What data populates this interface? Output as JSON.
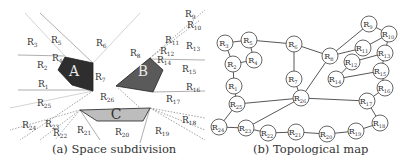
{
  "figure": {
    "left_panel": {
      "caption": "(a) Space subdivision",
      "obstacles": [
        {
          "label": "A",
          "fill": "#2e2e2e",
          "points": [
            [
              65,
              57
            ],
            [
              58,
              70
            ],
            [
              72,
              85
            ],
            [
              93,
              91
            ],
            [
              93,
              63
            ]
          ],
          "label_pos": [
            74,
            76
          ]
        },
        {
          "label": "B",
          "fill": "#5a5a5a",
          "points": [
            [
              150,
              58
            ],
            [
              163,
              70
            ],
            [
              153,
              92
            ],
            [
              116,
              86
            ]
          ],
          "label_pos": [
            143,
            76
          ]
        },
        {
          "label": "C",
          "fill": "#bdbdbd",
          "points": [
            [
              80,
              110
            ],
            [
              150,
              108
            ],
            [
              143,
              121
            ],
            [
              97,
              121
            ]
          ],
          "label_pos": [
            116,
            119
          ]
        }
      ],
      "solid_lines": [
        [
          [
            18,
            55
          ],
          [
            65,
            56
          ]
        ],
        [
          [
            18,
            90
          ],
          [
            93,
            90
          ]
        ],
        [
          [
            150,
            59
          ],
          [
            205,
            60
          ]
        ],
        [
          [
            153,
            92
          ],
          [
            205,
            91
          ]
        ],
        [
          [
            40,
            13
          ],
          [
            93,
            63
          ]
        ],
        [
          [
            80,
            110
          ],
          [
            100,
            140
          ]
        ],
        [
          [
            150,
            108
          ],
          [
            140,
            143
          ]
        ]
      ],
      "dashed_lines": [
        [
          [
            93,
            91
          ],
          [
            20,
            140
          ]
        ],
        [
          [
            80,
            110
          ],
          [
            10,
            130
          ]
        ],
        [
          [
            80,
            110
          ],
          [
            40,
            140
          ]
        ],
        [
          [
            80,
            110
          ],
          [
            55,
            140
          ]
        ],
        [
          [
            150,
            108
          ],
          [
            205,
            130
          ]
        ],
        [
          [
            150,
            108
          ],
          [
            205,
            140
          ]
        ],
        [
          [
            150,
            58
          ],
          [
            205,
            10
          ]
        ],
        [
          [
            150,
            58
          ],
          [
            200,
            20
          ]
        ],
        [
          [
            116,
            86
          ],
          [
            140,
            108
          ]
        ],
        [
          [
            150,
            108
          ],
          [
            205,
            118
          ]
        ]
      ],
      "faint_lines": [
        [
          [
            25,
            13
          ],
          [
            65,
            56
          ]
        ],
        [
          [
            93,
            63
          ],
          [
            140,
            13
          ]
        ],
        [
          [
            116,
            86
          ],
          [
            150,
            58
          ]
        ],
        [
          [
            10,
            108
          ],
          [
            93,
            91
          ]
        ]
      ],
      "region_labels": [
        {
          "text": "R3",
          "x": 27,
          "y": 45
        },
        {
          "text": "R5",
          "x": 51,
          "y": 43
        },
        {
          "text": "R6",
          "x": 96,
          "y": 46
        },
        {
          "text": "R4",
          "x": 52,
          "y": 61
        },
        {
          "text": "R2",
          "x": 37,
          "y": 68
        },
        {
          "text": "R7",
          "x": 95,
          "y": 80
        },
        {
          "text": "R1",
          "x": 38,
          "y": 87
        },
        {
          "text": "R8",
          "x": 130,
          "y": 56
        },
        {
          "text": "R9",
          "x": 185,
          "y": 17
        },
        {
          "text": "R10",
          "x": 187,
          "y": 28
        },
        {
          "text": "R11",
          "x": 165,
          "y": 43
        },
        {
          "text": "R13",
          "x": 186,
          "y": 49
        },
        {
          "text": "R12",
          "x": 160,
          "y": 54
        },
        {
          "text": "R14",
          "x": 157,
          "y": 63
        },
        {
          "text": "R15",
          "x": 182,
          "y": 72
        },
        {
          "text": "R16",
          "x": 186,
          "y": 90
        },
        {
          "text": "R25",
          "x": 37,
          "y": 106
        },
        {
          "text": "R26",
          "x": 100,
          "y": 100
        },
        {
          "text": "R17",
          "x": 166,
          "y": 102
        },
        {
          "text": "R18",
          "x": 182,
          "y": 123
        },
        {
          "text": "R24",
          "x": 22,
          "y": 128
        },
        {
          "text": "R23",
          "x": 45,
          "y": 127
        },
        {
          "text": "R22",
          "x": 53,
          "y": 136
        },
        {
          "text": "R21",
          "x": 77,
          "y": 133
        },
        {
          "text": "R20",
          "x": 115,
          "y": 135
        },
        {
          "text": "R19",
          "x": 155,
          "y": 134
        }
      ]
    },
    "right_panel": {
      "caption": "(b) Topological map",
      "node_radius": 8,
      "nodes": [
        {
          "id": "R3",
          "x": 225,
          "y": 43
        },
        {
          "id": "R5",
          "x": 249,
          "y": 40
        },
        {
          "id": "R6",
          "x": 294,
          "y": 44
        },
        {
          "id": "R4",
          "x": 254,
          "y": 60
        },
        {
          "id": "R2",
          "x": 233,
          "y": 64
        },
        {
          "id": "R1",
          "x": 234,
          "y": 86
        },
        {
          "id": "R7",
          "x": 294,
          "y": 79
        },
        {
          "id": "R8",
          "x": 330,
          "y": 56
        },
        {
          "id": "R9",
          "x": 369,
          "y": 24
        },
        {
          "id": "R10",
          "x": 389,
          "y": 34
        },
        {
          "id": "R11",
          "x": 363,
          "y": 48
        },
        {
          "id": "R13",
          "x": 385,
          "y": 53
        },
        {
          "id": "R12",
          "x": 352,
          "y": 62
        },
        {
          "id": "R15",
          "x": 381,
          "y": 71
        },
        {
          "id": "R14",
          "x": 336,
          "y": 79
        },
        {
          "id": "R16",
          "x": 385,
          "y": 88
        },
        {
          "id": "R26",
          "x": 301,
          "y": 98
        },
        {
          "id": "R25",
          "x": 237,
          "y": 104
        },
        {
          "id": "R17",
          "x": 367,
          "y": 101
        },
        {
          "id": "R18",
          "x": 380,
          "y": 123
        },
        {
          "id": "R24",
          "x": 219,
          "y": 127
        },
        {
          "id": "R23",
          "x": 246,
          "y": 128
        },
        {
          "id": "R22",
          "x": 268,
          "y": 133
        },
        {
          "id": "R21",
          "x": 296,
          "y": 132
        },
        {
          "id": "R20",
          "x": 327,
          "y": 134
        },
        {
          "id": "R19",
          "x": 356,
          "y": 131
        }
      ],
      "edges": [
        [
          "R3",
          "R5"
        ],
        [
          "R3",
          "R2"
        ],
        [
          "R5",
          "R4"
        ],
        [
          "R5",
          "R6"
        ],
        [
          "R2",
          "R4"
        ],
        [
          "R2",
          "R1"
        ],
        [
          "R1",
          "R25"
        ],
        [
          "R25",
          "R24"
        ],
        [
          "R25",
          "R26"
        ],
        [
          "R6",
          "R7"
        ],
        [
          "R6",
          "R8"
        ],
        [
          "R7",
          "R26"
        ],
        [
          "R8",
          "R26"
        ],
        [
          "R8",
          "R9"
        ],
        [
          "R8",
          "R11"
        ],
        [
          "R9",
          "R10"
        ],
        [
          "R10",
          "R11"
        ],
        [
          "R10",
          "R13"
        ],
        [
          "R13",
          "R12"
        ],
        [
          "R12",
          "R14"
        ],
        [
          "R14",
          "R15"
        ],
        [
          "R13",
          "R15"
        ],
        [
          "R15",
          "R16"
        ],
        [
          "R16",
          "R17"
        ],
        [
          "R26",
          "R17"
        ],
        [
          "R17",
          "R18"
        ],
        [
          "R18",
          "R19"
        ],
        [
          "R19",
          "R20"
        ],
        [
          "R20",
          "R21"
        ],
        [
          "R21",
          "R22"
        ],
        [
          "R22",
          "R23"
        ],
        [
          "R23",
          "R24"
        ],
        [
          "R23",
          "R26"
        ]
      ]
    }
  }
}
